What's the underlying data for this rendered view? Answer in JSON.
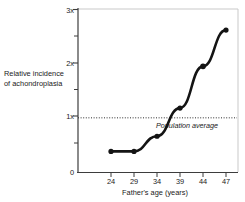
{
  "chart_data": {
    "type": "line",
    "title": "",
    "xlabel": "Father's age (years)",
    "ylabel_line1": "Relative incidence",
    "ylabel_line2": "of achondroplasia",
    "categories": [
      "24",
      "29",
      "34",
      "39",
      "44",
      "47"
    ],
    "x": [
      24,
      29,
      34,
      39,
      44,
      47
    ],
    "values": [
      0.38,
      0.38,
      0.66,
      1.18,
      1.95,
      2.62
    ],
    "series": [
      {
        "name": "Relative incidence of achondroplasia",
        "values": [
          0.38,
          0.38,
          0.66,
          1.18,
          1.95,
          2.62
        ]
      }
    ],
    "ylim": [
      0,
      3
    ],
    "yticks": [
      "0",
      "1x",
      "2x",
      "3x"
    ],
    "ytick_values": [
      0,
      1,
      2,
      3
    ],
    "yminor_ticks": [
      0.5,
      1.5,
      2.5
    ],
    "xticklabels": [
      "24",
      "29",
      "34",
      "39",
      "44",
      "47"
    ],
    "grid": false,
    "legend": "none",
    "marker": "filled-circle",
    "line_color": "#141414",
    "reference_line": {
      "label": "Population average",
      "value": 1,
      "ytick_label": "1x",
      "style": "dotted"
    },
    "annotations": [
      {
        "text": "Population average",
        "value": 1
      }
    ]
  },
  "axis": {
    "y_label_lines": [
      "Relative incidence",
      "of achondroplasia"
    ],
    "x_title": "Father's age (years)"
  },
  "colors": {
    "line": "#141414",
    "axis": "#3d3d3d",
    "frame": "#c9c9c9",
    "text": "#1a1a1a",
    "reference": "#2b2b2b"
  }
}
